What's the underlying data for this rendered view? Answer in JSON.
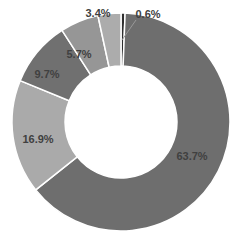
{
  "chart_data": {
    "type": "pie",
    "subtype": "donut",
    "title": "",
    "categories": [
      "Slice 1",
      "Slice 2",
      "Slice 3",
      "Slice 4",
      "Slice 5",
      "Slice 6"
    ],
    "values": [
      0.6,
      63.7,
      16.9,
      9.7,
      5.7,
      3.4
    ],
    "labels": [
      "0.6%",
      "63.7%",
      "16.9%",
      "9.7%",
      "5.7%",
      "3.4%"
    ],
    "colors": [
      "#2e2e2e",
      "#6e6e6e",
      "#aaaaaa",
      "#707070",
      "#969696",
      "#acacac"
    ],
    "start_angle_deg": 0,
    "direction": "clockwise",
    "legend": "none"
  }
}
